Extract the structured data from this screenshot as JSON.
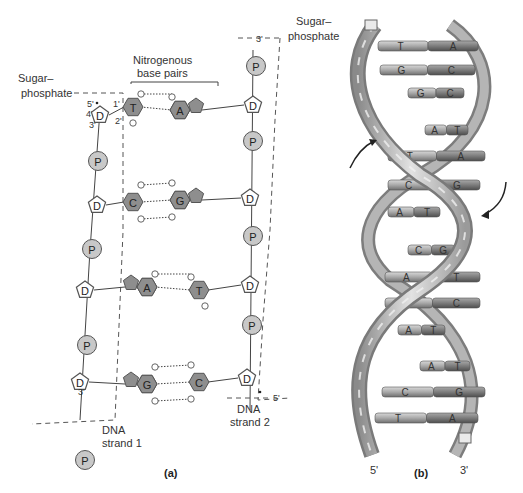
{
  "panel_a": {
    "caption": "(a)",
    "labels": {
      "sugar_phosphate_left": [
        "Sugar–",
        "phosphate"
      ],
      "sugar_phosphate_right": [
        "Sugar–",
        "phosphate"
      ],
      "base_pairs": [
        "Nitrogenous",
        "base pairs"
      ],
      "strand1": [
        "DNA",
        "strand 1"
      ],
      "strand2": [
        "DNA",
        "strand 2"
      ],
      "carbon_numbers": {
        "c5": "5'",
        "c4": "4'",
        "c3": "3'",
        "c1": "1'",
        "c2": "2'"
      },
      "strand1_end": "3'",
      "strand2_top": "3'",
      "strand2_end": "5'"
    },
    "phosphate_symbol": "P",
    "sugar_symbol": "D",
    "base_pairs": [
      {
        "left": "T",
        "right": "A",
        "h_bonds": 2
      },
      {
        "left": "C",
        "right": "G",
        "h_bonds": 3
      },
      {
        "left": "A",
        "right": "T",
        "h_bonds": 2
      },
      {
        "left": "G",
        "right": "C",
        "h_bonds": 3
      }
    ]
  },
  "panel_b": {
    "caption": "(b)",
    "end_left": "5'",
    "end_right": "3'",
    "rungs": [
      {
        "left": "T",
        "right": "A"
      },
      {
        "left": "G",
        "right": "C"
      },
      {
        "left": "G",
        "right": "C"
      },
      {
        "left": "A",
        "right": "T"
      },
      {
        "left": "T",
        "right": "A"
      },
      {
        "left": "C",
        "right": "G"
      },
      {
        "left": "A",
        "right": "T"
      },
      {
        "left": "C",
        "right": "G"
      },
      {
        "left": "A",
        "right": "T"
      },
      {
        "left": "G",
        "right": "C"
      },
      {
        "left": "A",
        "right": "T"
      },
      {
        "left": "A",
        "right": "T"
      },
      {
        "left": "C",
        "right": "G"
      },
      {
        "left": "T",
        "right": "A"
      }
    ]
  },
  "colors": {
    "phosphate": "#c8c8c8",
    "base": "#8e8e8e",
    "backbone": "#bdbdbd",
    "rung_light": "#b8b8b8",
    "rung_dark": "#7a7a7a"
  }
}
